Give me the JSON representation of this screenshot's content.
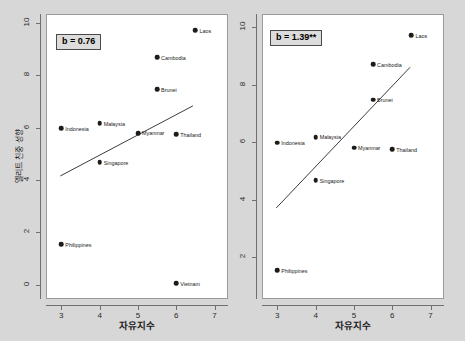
{
  "figure": {
    "background_color": "#d7d7d7",
    "panel_background_color": "#ffffff",
    "point_color": "#1c1c1c",
    "fit_line_color": "#3a3a3a"
  },
  "chart_data": [
    {
      "type": "scatter",
      "panel": "left",
      "title": "",
      "xlabel": "자유지수",
      "ylabel": "엘리트 친중 성향",
      "xlim": [
        2.6,
        7.35
      ],
      "ylim": [
        -0.55,
        10.35
      ],
      "xticks": [
        3,
        4,
        5,
        6,
        7
      ],
      "yticks": [
        0,
        2,
        4,
        6,
        8,
        10
      ],
      "xtick_labels": [
        "3",
        "4",
        "5",
        "6",
        "7"
      ],
      "ytick_labels": [
        "0",
        "2",
        "4",
        "6",
        "8",
        "10"
      ],
      "grid": false,
      "annotation": "b = 0.76",
      "fit_line": {
        "x0": 2.95,
        "y0": 4.15,
        "x1": 6.45,
        "y1": 6.85
      },
      "points": [
        {
          "label": "Indonesia",
          "x": 3.0,
          "y": 5.98,
          "label_side": "right"
        },
        {
          "label": "Philippines",
          "x": 3.0,
          "y": 1.55,
          "label_side": "right"
        },
        {
          "label": "Malaysia",
          "x": 4.0,
          "y": 6.18,
          "label_side": "right"
        },
        {
          "label": "Singapore",
          "x": 4.0,
          "y": 4.68,
          "label_side": "right"
        },
        {
          "label": "Myanmar",
          "x": 5.0,
          "y": 5.8,
          "label_side": "right"
        },
        {
          "label": "Cambodia",
          "x": 5.5,
          "y": 8.7,
          "label_side": "right"
        },
        {
          "label": "Brunei",
          "x": 5.5,
          "y": 7.48,
          "label_side": "right"
        },
        {
          "label": "Thailand",
          "x": 6.0,
          "y": 5.76,
          "label_side": "right"
        },
        {
          "label": "Vietnam",
          "x": 6.0,
          "y": 0.05,
          "label_side": "right"
        },
        {
          "label": "Laos",
          "x": 6.5,
          "y": 9.72,
          "label_side": "right"
        }
      ]
    },
    {
      "type": "scatter",
      "panel": "right",
      "title": "",
      "xlabel": "자유지수",
      "ylabel": "",
      "xlim": [
        2.6,
        7.35
      ],
      "ylim": [
        0.55,
        10.45
      ],
      "xticks": [
        3,
        4,
        5,
        6,
        7
      ],
      "yticks": [
        2,
        4,
        6,
        8,
        10
      ],
      "xtick_labels": [
        "3",
        "4",
        "5",
        "6",
        "7"
      ],
      "ytick_labels": [
        "2",
        "4",
        "6",
        "8",
        "10"
      ],
      "grid": false,
      "annotation": "b = 1.39**",
      "fit_line": {
        "x0": 2.95,
        "y0": 3.7,
        "x1": 6.48,
        "y1": 8.62
      },
      "points": [
        {
          "label": "Indonesia",
          "x": 3.0,
          "y": 5.98,
          "label_side": "right"
        },
        {
          "label": "Philippines",
          "x": 3.0,
          "y": 1.55,
          "label_side": "right"
        },
        {
          "label": "Malaysia",
          "x": 4.0,
          "y": 6.18,
          "label_side": "right"
        },
        {
          "label": "Singapore",
          "x": 4.0,
          "y": 4.68,
          "label_side": "right"
        },
        {
          "label": "Myanmar",
          "x": 5.0,
          "y": 5.8,
          "label_side": "right"
        },
        {
          "label": "Cambodia",
          "x": 5.5,
          "y": 8.7,
          "label_side": "right"
        },
        {
          "label": "Brunei",
          "x": 5.5,
          "y": 7.48,
          "label_side": "right"
        },
        {
          "label": "Thailand",
          "x": 6.0,
          "y": 5.76,
          "label_side": "right"
        },
        {
          "label": "Laos",
          "x": 6.5,
          "y": 9.72,
          "label_side": "right"
        }
      ]
    }
  ]
}
